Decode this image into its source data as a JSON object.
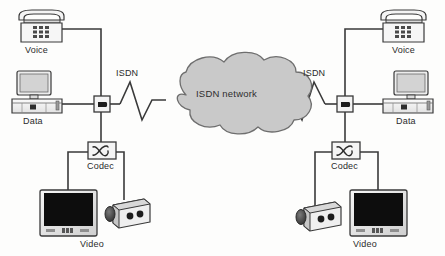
{
  "diagram": {
    "background_color": "#fdfdfc",
    "line_color": "#3a3a3a",
    "cloud_fill": "#c9c9c9",
    "cloud_stroke": "#6e6e6e",
    "screen_color": "#0d0d0d",
    "device_fill": "#f2f2f2",
    "device_stroke": "#4a4a4a",
    "cloud": {
      "label": "ISDN network"
    },
    "left_site": {
      "voice_label": "Voice",
      "data_label": "Data",
      "isdn_label": "ISDN",
      "codec_label": "Codec",
      "video_label": "Video",
      "nt1_name": "NT1 network termination",
      "codec_symbol": "codec-waveform-symbol"
    },
    "right_site": {
      "voice_label": "Voice",
      "data_label": "Data",
      "isdn_label": "ISDN",
      "codec_label": "Codec",
      "video_label": "Video",
      "nt1_name": "NT1 network termination",
      "codec_symbol": "codec-waveform-symbol"
    }
  }
}
